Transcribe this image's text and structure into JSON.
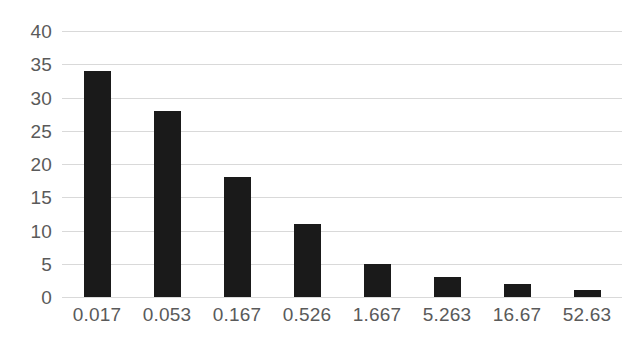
{
  "chart_data": {
    "type": "bar",
    "title": "",
    "subtitle": "",
    "xlabel": "",
    "ylabel": "",
    "categories": [
      "0.017",
      "0.053",
      "0.167",
      "0.526",
      "1.667",
      "5.263",
      "16.67",
      "52.63"
    ],
    "values": [
      34,
      28,
      18,
      11,
      5,
      3,
      2,
      1
    ],
    "series": [
      {
        "name": "",
        "values": [
          34,
          28,
          18,
          11,
          5,
          3,
          2,
          1
        ]
      }
    ],
    "ylim": [
      0,
      40
    ],
    "y_ticks": [
      0,
      5,
      10,
      15,
      20,
      25,
      30,
      35,
      40
    ],
    "y_tick_labels": [
      "0",
      "5",
      "10",
      "15",
      "20",
      "25",
      "30",
      "35",
      "40"
    ],
    "grid": true,
    "grid_axis": "y",
    "legend": false,
    "legend_position": "none",
    "colors": {
      "bar": "#1a1a1a",
      "gridline": "#d9d9d9",
      "tick_label": "#5a5a5a",
      "background": "#ffffff"
    }
  }
}
